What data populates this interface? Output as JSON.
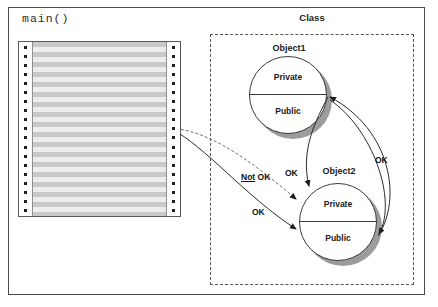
{
  "figure": {
    "caption_main": "main()",
    "class_label": "Class",
    "objects": [
      {
        "id": "object1",
        "title": "Object1",
        "top_half_label": "Private",
        "bottom_half_label": "Public"
      },
      {
        "id": "object2",
        "title": "Object2",
        "top_half_label": "Private",
        "bottom_half_label": "Public"
      }
    ],
    "arrow_labels": {
      "not_ok_prefix": "Not",
      "not_ok_suffix": " OK",
      "ok_lower_left": "OK",
      "ok_mid": "OK",
      "ok_right": "OK"
    },
    "colors": {
      "ink": "#1e1e1e",
      "frame": "#4a4a4a",
      "dashed_border": "#555555",
      "shadow": "#9c9c9c",
      "stripe_dark": "#c9c9c9",
      "stripe_light": "#ededed"
    }
  }
}
